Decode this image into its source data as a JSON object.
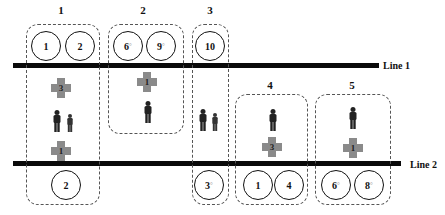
{
  "lines": [
    {
      "id": "line1",
      "label": "Line 1"
    },
    {
      "id": "line2",
      "label": "Line 2"
    }
  ],
  "groups": [
    {
      "label": "1",
      "above_line1": [
        "1",
        "2"
      ],
      "cross_upper": "3",
      "persons": 2,
      "cross_lower": "1",
      "below_line2": [
        "2"
      ]
    },
    {
      "label": "2",
      "above_line1": [
        "6",
        "9"
      ],
      "cross_upper": "1",
      "persons": 1
    },
    {
      "label": "3",
      "above_line1": [
        "10"
      ],
      "persons": 2,
      "below_line2": [
        "3"
      ]
    },
    {
      "label": "4",
      "persons": 1,
      "cross": "3",
      "below_line2": [
        "1",
        "4"
      ]
    },
    {
      "label": "5",
      "persons": 1,
      "cross": "1",
      "below_line2": [
        "6",
        "8"
      ]
    }
  ],
  "degree_mark": "°",
  "colors": {
    "line": "#0a0a0a",
    "cross": "#8a8a8a",
    "box_border": "#555555"
  }
}
